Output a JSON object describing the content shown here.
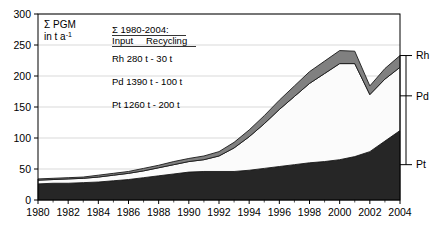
{
  "chart_data": {
    "type": "area",
    "stacked": true,
    "title": "",
    "subtitle": "",
    "xlabel": "",
    "ylabel": "Σ PGM in t a⁻¹",
    "ylabel_line1": "Σ PGM",
    "ylabel_line2": "in t a",
    "ylabel_line2_sup": "-1",
    "x": [
      1980,
      1981,
      1982,
      1983,
      1984,
      1985,
      1986,
      1987,
      1988,
      1989,
      1990,
      1991,
      1992,
      1993,
      1994,
      1995,
      1996,
      1997,
      1998,
      1999,
      2000,
      2001,
      2002,
      2003,
      2004
    ],
    "xlim": [
      1980,
      2004
    ],
    "ylim": [
      0,
      300
    ],
    "yticks": [
      0,
      50,
      100,
      150,
      200,
      250,
      300
    ],
    "xticks": [
      1980,
      1982,
      1984,
      1986,
      1988,
      1990,
      1992,
      1994,
      1996,
      1998,
      2000,
      2002,
      2004
    ],
    "xtick_labels": [
      "1980",
      "1982",
      "1984",
      "1986",
      "1988",
      "1990",
      "1992",
      "1994",
      "1996",
      "1998",
      "2000",
      "2002",
      "2004"
    ],
    "ytick_labels": [
      "0",
      "50",
      "100",
      "150",
      "200",
      "250",
      "300"
    ],
    "grid": true,
    "legend_position": "right-outside",
    "series": [
      {
        "name": "Pt",
        "color": "#262626",
        "values": [
          26,
          27,
          27,
          28,
          29,
          31,
          33,
          36,
          39,
          42,
          45,
          46,
          46,
          46,
          48,
          51,
          54,
          57,
          60,
          62,
          65,
          70,
          78,
          95,
          112
        ]
      },
      {
        "name": "Pd",
        "color": "#fbfbfb",
        "values": [
          6,
          6,
          7,
          7,
          8,
          9,
          10,
          11,
          13,
          15,
          17,
          19,
          25,
          38,
          54,
          72,
          92,
          110,
          128,
          142,
          155,
          150,
          92,
          100,
          102
        ]
      },
      {
        "name": "Rh",
        "color": "#808080",
        "values": [
          2,
          2,
          2,
          2,
          3,
          3,
          3,
          4,
          4,
          5,
          5,
          6,
          7,
          9,
          11,
          13,
          15,
          17,
          19,
          20,
          21,
          20,
          14,
          17,
          19
        ]
      }
    ],
    "series_labels_right": [
      {
        "name": "Rh",
        "y_value": 233
      },
      {
        "name": "Pd",
        "y_value": 168
      },
      {
        "name": "Pt",
        "y_value": 57
      }
    ],
    "annotations": {
      "legend_box": {
        "header_line1": "Σ 1980-2004:",
        "header_line2_col1": "Input",
        "header_line2_col2": "Recycling",
        "rows": [
          {
            "element": "Rh",
            "input": "280 t",
            "recycling": "- 30 t",
            "full": "Rh 280 t  - 30 t"
          },
          {
            "element": "Pd",
            "input": "1390 t",
            "recycling": "- 100 t",
            "full": "Pd 1390 t - 100 t"
          },
          {
            "element": "Pt",
            "input": "1260 t",
            "recycling": "- 200 t",
            "full": "Pt 1260 t - 200 t"
          }
        ]
      }
    }
  }
}
